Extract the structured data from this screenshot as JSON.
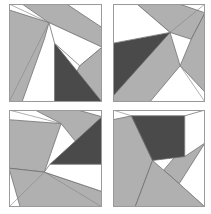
{
  "figure": {
    "background_color": "#ffffff",
    "width": 211,
    "height": 214
  },
  "palette": {
    "white": "#ffffff",
    "gray": "#b0b0b0",
    "light_gray": "#c4c4c4",
    "dark_gray": "#4a4a4a",
    "outline": "#6e6e6e",
    "frame": "#9a9a9a"
  },
  "grid": {
    "rows": 2,
    "columns": 2,
    "tile_width": 93,
    "tile_height": 98,
    "gap_x": 11,
    "gap_y": 10
  },
  "tiles": [
    {
      "id": "tile-top-left",
      "label": "Tile 1",
      "position": {
        "x": 9,
        "y": 4,
        "w": 93,
        "h": 98
      },
      "viewbox": "0 0 100 100",
      "shapes": [
        {
          "name": "white-background",
          "fill": "white",
          "points": "0,0 100,0 100,100 0,100"
        },
        {
          "name": "gray-upper-band",
          "fill": "gray",
          "points": "14,0 62,0 100,24 100,44 43,19"
        },
        {
          "name": "gray-left-band",
          "fill": "gray",
          "points": "0,6 43,19 38,36 14,100 0,100"
        },
        {
          "name": "gray-right-wedge",
          "fill": "gray",
          "points": "100,44 100,100 57,100 76,63"
        },
        {
          "name": "dark-triangle",
          "fill": "dark_gray",
          "points": "49,40 100,100 49,100"
        },
        {
          "name": "white-center-wedge",
          "fill": "white",
          "points": "43,19 100,44 76,63 49,40"
        }
      ],
      "hairlines": [
        "0,0 43,19",
        "0,100 43,19"
      ]
    },
    {
      "id": "tile-top-right",
      "label": "Tile 2",
      "position": {
        "x": 113,
        "y": 4,
        "w": 92,
        "h": 98
      },
      "viewbox": "0 0 100 100",
      "shapes": [
        {
          "name": "white-background",
          "fill": "white",
          "points": "0,0 100,0 100,100 0,100"
        },
        {
          "name": "gray-upper-band",
          "fill": "gray",
          "points": "26,0 72,0 100,9 85,36 62,29"
        },
        {
          "name": "gray-right-band",
          "fill": "gray",
          "points": "100,9 100,90 73,63 85,36"
        },
        {
          "name": "gray-lower-wedge",
          "fill": "gray",
          "points": "62,29 73,63 40,100 0,100 0,86"
        },
        {
          "name": "dark-triangle",
          "fill": "dark_gray",
          "points": "0,40 62,29 0,94"
        },
        {
          "name": "white-left-region",
          "fill": "white",
          "points": "0,0 26,0 62,29 0,40"
        }
      ],
      "hairlines": [
        "100,0 62,29",
        "100,100 73,63"
      ]
    },
    {
      "id": "tile-bottom-left",
      "label": "Tile 3",
      "position": {
        "x": 9,
        "y": 110,
        "w": 93,
        "h": 97
      },
      "viewbox": "0 0 100 100",
      "shapes": [
        {
          "name": "white-background",
          "fill": "white",
          "points": "0,0 100,0 100,100 0,100"
        },
        {
          "name": "gray-upper-band",
          "fill": "gray",
          "points": "28,0 74,0 100,7 78,40 56,14"
        },
        {
          "name": "gray-left-band",
          "fill": "gray",
          "points": "0,10 0,60 38,64 56,14"
        },
        {
          "name": "gray-lower-band",
          "fill": "gray",
          "points": "0,60 38,64 100,84 100,100 12,100"
        },
        {
          "name": "dark-triangle",
          "fill": "dark_gray",
          "points": "100,7 100,56 44,56"
        },
        {
          "name": "white-right-strip",
          "fill": "white",
          "points": "44,56 100,56 100,84 38,64"
        }
      ],
      "hairlines": [
        "0,0 56,14",
        "0,100 38,64",
        "100,100 38,64"
      ]
    },
    {
      "id": "tile-bottom-right",
      "label": "Tile 4",
      "position": {
        "x": 113,
        "y": 110,
        "w": 92,
        "h": 97
      },
      "viewbox": "0 0 100 100",
      "shapes": [
        {
          "name": "white-background",
          "fill": "white",
          "points": "0,0 100,0 100,100 0,100"
        },
        {
          "name": "gray-left-band",
          "fill": "gray",
          "points": "0,10 20,6 43,52 24,100 0,100"
        },
        {
          "name": "gray-right-band",
          "fill": "gray",
          "points": "100,12 100,34 72,76 55,62"
        },
        {
          "name": "gray-lower-band",
          "fill": "gray",
          "points": "43,52 55,62 72,76 100,100 24,100"
        },
        {
          "name": "dark-triangle",
          "fill": "dark_gray",
          "points": "20,6 78,6 78,48 43,52"
        },
        {
          "name": "white-upper-right",
          "fill": "white",
          "points": "78,6 100,0 100,34 78,48"
        }
      ],
      "hairlines": [
        "0,0 20,6",
        "100,100 72,76"
      ]
    }
  ]
}
